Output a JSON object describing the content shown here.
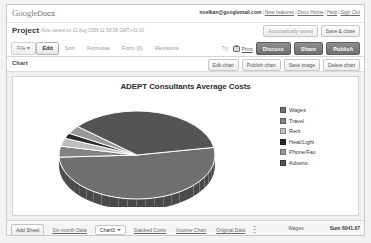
{
  "header": {
    "logo_primary": "Google",
    "logo_secondary": "Docs",
    "account_email": "noelkan@googlemail.com",
    "links": [
      "New features",
      "Docs Home",
      "Help",
      "Sign Out"
    ]
  },
  "document": {
    "title": "Project",
    "saved_status": "Auto-saved on 11 Aug 2009 11:58:38 GMT+01:00",
    "autosave_button": "Automatically saved",
    "save_close_button": "Save & close"
  },
  "menubar": {
    "items": [
      "File ▾",
      "Edit",
      "Sort",
      "Formulas",
      "Form (0)",
      "Revisions"
    ],
    "hint": "Tip",
    "print_label": "Print",
    "actions": [
      "Discuss",
      "Share",
      "Publish"
    ]
  },
  "chartbar": {
    "label": "Chart",
    "buttons": [
      "Edit chart",
      "Publish chart",
      "Save image",
      "Delete chart"
    ]
  },
  "chart_data": {
    "type": "pie",
    "title": "ADEPT Consultants Average Costs",
    "xlabel": "",
    "ylabel": "",
    "legend_position": "right",
    "three_d": true,
    "categories": [
      "Wages",
      "Travel",
      "Rent",
      "Heat/Light",
      "Phone/Fax",
      "Adverts"
    ],
    "values": [
      52,
      4,
      3,
      2,
      3,
      36
    ],
    "colors": [
      "#6f6f6f",
      "#828282",
      "#bdbdbd",
      "#2b2b2b",
      "#989898",
      "#545454"
    ]
  },
  "footer": {
    "add_sheet_button": "Add Sheet",
    "tabs": [
      {
        "label": "Six-month Data",
        "active": false
      },
      {
        "label": "Chart3",
        "active": true
      },
      {
        "label": "Stacked Costs",
        "active": false
      },
      {
        "label": "Income Chart",
        "active": false
      },
      {
        "label": "Original Data",
        "active": false
      }
    ],
    "status_name": "Wages",
    "status_sum": "Sum 6041.67"
  }
}
